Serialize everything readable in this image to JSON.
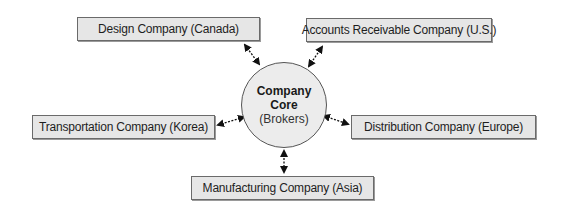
{
  "diagram": {
    "core": {
      "title_line1": "Company",
      "title_line2": "Core",
      "subtitle": "(Brokers)"
    },
    "nodes": [
      {
        "id": "design",
        "label": "Design Company (Canada)"
      },
      {
        "id": "accounts",
        "label": "Accounts Receivable Company (U.S.)"
      },
      {
        "id": "transportation",
        "label": "Transportation Company (Korea)"
      },
      {
        "id": "distribution",
        "label": "Distribution Company (Europe)"
      },
      {
        "id": "manufacturing",
        "label": "Manufacturing Company (Asia)"
      }
    ],
    "edges": [
      {
        "from": "core",
        "to": "design",
        "style": "dashed-bidirectional"
      },
      {
        "from": "core",
        "to": "accounts",
        "style": "dashed-bidirectional"
      },
      {
        "from": "core",
        "to": "transportation",
        "style": "dashed-bidirectional"
      },
      {
        "from": "core",
        "to": "distribution",
        "style": "dashed-bidirectional"
      },
      {
        "from": "core",
        "to": "manufacturing",
        "style": "dashed-bidirectional"
      }
    ],
    "colors": {
      "box_fill": "#e6e6e6",
      "box_border": "#6a6a6a",
      "circle_fill": "#ececec",
      "text": "#1e1e1e"
    }
  }
}
